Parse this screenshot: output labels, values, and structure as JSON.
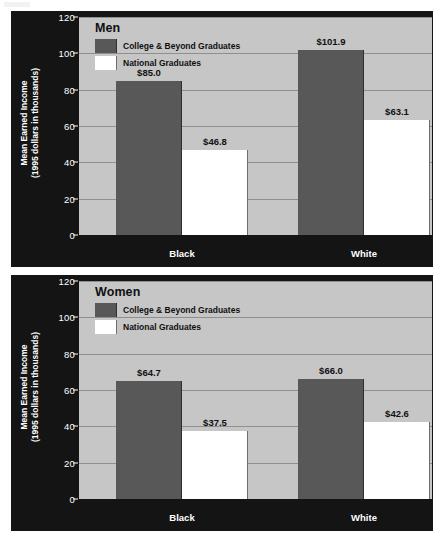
{
  "figure": {
    "background_color": "#ffffff",
    "panel_color": "#141414",
    "plot_color": "#c6c6c6",
    "gridline_color": "#8f8f8f",
    "series_colors": {
      "college_and_beyond": "#585858",
      "national": "#ffffff"
    }
  },
  "chart_data": [
    {
      "type": "bar",
      "title": "Men",
      "xlabel": "",
      "ylabel": "Mean Earned Income\n(1995 dollars in thousands)",
      "ylabel_line1": "Mean Earned Income",
      "ylabel_line2": "(1995 dollars in thousands)",
      "categories": [
        "Black",
        "White"
      ],
      "ylim": [
        0,
        120
      ],
      "yticks": [
        0,
        20,
        40,
        60,
        80,
        100,
        120
      ],
      "grid": true,
      "legend_position": "inside-top-left",
      "series": [
        {
          "name": "College & Beyond Graduates",
          "color": "#585858",
          "values": [
            85.0,
            101.9
          ],
          "labels": [
            "$85.0",
            "$101.9"
          ]
        },
        {
          "name": "National Graduates",
          "color": "#ffffff",
          "values": [
            46.8,
            63.1
          ],
          "labels": [
            "$46.8",
            "$63.1"
          ]
        }
      ]
    },
    {
      "type": "bar",
      "title": "Women",
      "xlabel": "",
      "ylabel": "Mean Earned Income\n(1995 dollars in thousands)",
      "ylabel_line1": "Mean Earned Income",
      "ylabel_line2": "(1995 dollars in thousands)",
      "categories": [
        "Black",
        "White"
      ],
      "ylim": [
        0,
        120
      ],
      "yticks": [
        0,
        20,
        40,
        60,
        80,
        100,
        120
      ],
      "grid": true,
      "legend_position": "inside-top-left",
      "series": [
        {
          "name": "College & Beyond Graduates",
          "color": "#585858",
          "values": [
            64.7,
            66.0
          ],
          "labels": [
            "$64.7",
            "$66.0"
          ]
        },
        {
          "name": "National Graduates",
          "color": "#ffffff",
          "values": [
            37.5,
            42.6
          ],
          "labels": [
            "$37.5",
            "$42.6"
          ]
        }
      ]
    }
  ]
}
